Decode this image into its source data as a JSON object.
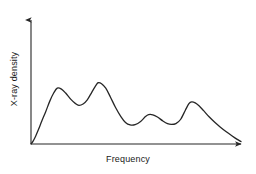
{
  "chart_data": {
    "type": "line",
    "title": "",
    "subtitle": "",
    "xlabel": "Frequency",
    "ylabel": "X-ray density",
    "grid": false,
    "legend": null,
    "axes_style": "arrow-tipped open axes, no tick marks, no tick labels",
    "line_color": "#262626",
    "line_width_px": 1.3,
    "xlim": [
      0,
      1
    ],
    "ylim": [
      0,
      1
    ],
    "annotations": [],
    "peaks": [
      {
        "index": 1,
        "x": 0.125,
        "y": 0.57
      },
      {
        "index": 2,
        "x": 0.32,
        "y": 0.625
      },
      {
        "index": 3,
        "x": 0.56,
        "y": 0.3
      },
      {
        "index": 4,
        "x": 0.765,
        "y": 0.43
      }
    ],
    "valleys": [
      {
        "index": 1,
        "x": 0.228,
        "y": 0.395
      },
      {
        "index": 2,
        "x": 0.472,
        "y": 0.195
      },
      {
        "index": 3,
        "x": 0.668,
        "y": 0.2
      }
    ],
    "x": [
      0.0,
      0.01,
      0.022,
      0.036,
      0.052,
      0.07,
      0.09,
      0.108,
      0.125,
      0.145,
      0.165,
      0.19,
      0.212,
      0.228,
      0.248,
      0.268,
      0.29,
      0.31,
      0.32,
      0.336,
      0.356,
      0.378,
      0.402,
      0.428,
      0.45,
      0.472,
      0.496,
      0.522,
      0.545,
      0.56,
      0.58,
      0.602,
      0.628,
      0.65,
      0.668,
      0.69,
      0.712,
      0.735,
      0.752,
      0.765,
      0.782,
      0.8,
      0.822,
      0.848,
      0.875,
      0.902,
      0.93,
      0.958,
      0.98,
      1.0
    ],
    "y": [
      0.0,
      0.03,
      0.08,
      0.15,
      0.238,
      0.33,
      0.44,
      0.52,
      0.57,
      0.56,
      0.52,
      0.455,
      0.412,
      0.395,
      0.408,
      0.45,
      0.53,
      0.6,
      0.625,
      0.615,
      0.57,
      0.48,
      0.375,
      0.28,
      0.22,
      0.195,
      0.198,
      0.23,
      0.28,
      0.3,
      0.298,
      0.275,
      0.235,
      0.208,
      0.2,
      0.208,
      0.25,
      0.345,
      0.412,
      0.43,
      0.42,
      0.39,
      0.34,
      0.278,
      0.222,
      0.172,
      0.125,
      0.082,
      0.05,
      0.025
    ],
    "series": [
      {
        "name": "X-ray density spectrum",
        "x": [
          0.0,
          0.01,
          0.022,
          0.036,
          0.052,
          0.07,
          0.09,
          0.108,
          0.125,
          0.145,
          0.165,
          0.19,
          0.212,
          0.228,
          0.248,
          0.268,
          0.29,
          0.31,
          0.32,
          0.336,
          0.356,
          0.378,
          0.402,
          0.428,
          0.45,
          0.472,
          0.496,
          0.522,
          0.545,
          0.56,
          0.58,
          0.602,
          0.628,
          0.65,
          0.668,
          0.69,
          0.712,
          0.735,
          0.752,
          0.765,
          0.782,
          0.8,
          0.822,
          0.848,
          0.875,
          0.902,
          0.93,
          0.958,
          0.98,
          1.0
        ],
        "values": [
          0.0,
          0.03,
          0.08,
          0.15,
          0.238,
          0.33,
          0.44,
          0.52,
          0.57,
          0.56,
          0.52,
          0.455,
          0.412,
          0.395,
          0.408,
          0.45,
          0.53,
          0.6,
          0.625,
          0.615,
          0.57,
          0.48,
          0.375,
          0.28,
          0.22,
          0.195,
          0.198,
          0.23,
          0.28,
          0.3,
          0.298,
          0.275,
          0.235,
          0.208,
          0.2,
          0.208,
          0.25,
          0.345,
          0.412,
          0.43,
          0.42,
          0.39,
          0.34,
          0.278,
          0.222,
          0.172,
          0.125,
          0.082,
          0.05,
          0.025
        ]
      }
    ]
  }
}
